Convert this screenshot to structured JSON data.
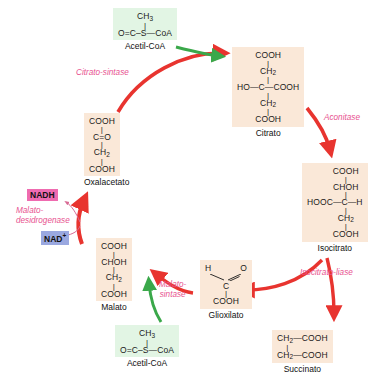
{
  "diagram": {
    "background_color": "#ffffff",
    "metabolite_box_color": "#fae8d8",
    "acetyl_box_color": "#e2f5e4",
    "cycle_arrow_color": "#e8342f",
    "input_arrow_color": "#3aa84a",
    "enzyme_label_color": "#e8528f",
    "nadh_badge_color": "#ef6bb0",
    "nad_badge_color": "#9aa8e0"
  },
  "metabolites": {
    "acetyl_coa_top": {
      "name": "Acetil-CoA",
      "lines": [
        "CH",
        "O=C—S—CoA"
      ],
      "line1_main": "CH",
      "line1_sub": "3",
      "line2": "O=C–S—CoA"
    },
    "citrato": {
      "name": "Citrato",
      "l1": "COOH",
      "l2_main": "CH",
      "l2_sub": "2",
      "l3": "HO—C—COOH",
      "l4_main": "CH",
      "l4_sub": "2",
      "l5": "COOH"
    },
    "isocitrato": {
      "name": "Isocitrato",
      "l1": "COOH",
      "l2": "CHOH",
      "l3": "HOOC—C—H",
      "l4_main": "CH",
      "l4_sub": "2",
      "l5": "COOH"
    },
    "succinato": {
      "name": "Succinato",
      "l1_main": "CH",
      "l1_sub": "2",
      "l1_rest": "—COOH",
      "l2_main": "CH",
      "l2_sub": "2",
      "l2_rest": "—COOH"
    },
    "glioxilato": {
      "name": "Glioxilato",
      "l1_left": "H",
      "l1_right": "O",
      "l2": "C",
      "l3": "COOH"
    },
    "acetyl_coa_bottom": {
      "name": "Acetil-CoA",
      "line1_main": "CH",
      "line1_sub": "3",
      "line2": "O=C–S—CoA"
    },
    "malato": {
      "name": "Malato",
      "l1": "COOH",
      "l2": "CHOH",
      "l3_main": "CH",
      "l3_sub": "2",
      "l4": "COOH"
    },
    "oxalacetato": {
      "name": "Oxalacetato",
      "l1": "COOH",
      "l2": "C=O",
      "l3_main": "CH",
      "l3_sub": "2",
      "l4": "COOH"
    }
  },
  "enzymes": {
    "citrato_sintase": "Citrato-sintase",
    "aconitase": "Aconitase",
    "isocitrato_liase": "Isocitrato-liase",
    "malato_sintase_l1": "Malato-",
    "malato_sintase_l2": "sintase",
    "malato_desidrogenase_l1": "Malato-",
    "malato_desidrogenase_l2": "desidrogenase"
  },
  "cofactors": {
    "nadh": "NADH",
    "nad_main": "NAD",
    "nad_sup": "+"
  }
}
